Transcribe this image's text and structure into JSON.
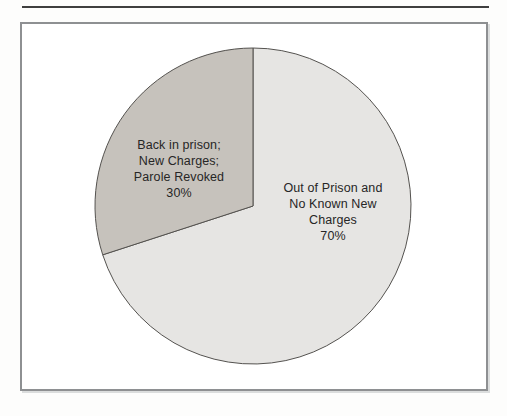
{
  "figure": {
    "background": "#ffffff",
    "frame_border_color": "#8e9092",
    "top_rule_color": "#3f3f3f",
    "text_color": "#262626"
  },
  "chart_data": {
    "type": "pie",
    "title": "",
    "categories": [
      "Back in prison; New Charges; Parole Revoked",
      "Out of Prison and No Known New Charges"
    ],
    "values": [
      30,
      70
    ],
    "unit": "%",
    "start_angle_deg": 90,
    "direction": "counterclockwise",
    "colors": [
      "#c6c2bc",
      "#e6e5e3"
    ],
    "outline_color": "#54524f",
    "legend": "none",
    "slices": [
      {
        "value": 30,
        "percent_label": "30%",
        "color": "#c6c2bc",
        "label_lines": [
          "Back in prison;",
          "New Charges;",
          "Parole Revoked",
          "30%"
        ]
      },
      {
        "value": 70,
        "percent_label": "70%",
        "color": "#e6e5e3",
        "label_lines": [
          "Out of Prison and",
          "No Known New",
          "Charges",
          "70%"
        ]
      }
    ]
  }
}
